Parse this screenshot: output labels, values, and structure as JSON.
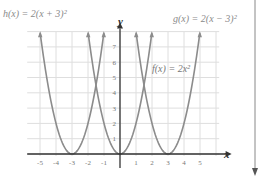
{
  "chart_data": {
    "type": "line",
    "title": "",
    "xlabel": "x",
    "ylabel": "y",
    "xlim": [
      -6,
      6
    ],
    "ylim": [
      0,
      8
    ],
    "grid": true,
    "x_ticks": [
      -5,
      -4,
      -3,
      -2,
      -1,
      1,
      2,
      3,
      4,
      5
    ],
    "y_ticks": [
      1,
      2,
      3,
      4,
      5,
      6,
      7
    ],
    "series": [
      {
        "name": "h(x) = 2(x + 3)^2",
        "label": "h(x) = 2(x + 3)²",
        "a": 2,
        "h": -3,
        "vertex": [
          -3,
          0
        ]
      },
      {
        "name": "f(x) = 2x^2",
        "label": "f(x) = 2x²",
        "a": 2,
        "h": 0,
        "vertex": [
          0,
          0
        ]
      },
      {
        "name": "g(x) = 2(x - 3)^2",
        "label": "g(x) = 2(x − 3)²",
        "a": 2,
        "h": 3,
        "vertex": [
          3,
          0
        ]
      }
    ],
    "annotations": [
      "h(x) = 2(x + 3)²",
      "g(x) = 2(x − 3)²",
      "f(x) = 2x²"
    ],
    "legend": "none (inline labels)"
  },
  "labels": {
    "h": "h(x) = 2(x + 3)²",
    "g": "g(x) = 2(x − 3)²",
    "f": "f(x) = 2x²",
    "x_axis": "x",
    "y_axis": "y"
  },
  "colors": {
    "curve": "#8c8c8c",
    "grid": "#dedede",
    "axis": "#333333",
    "tick_text": "#777777"
  }
}
